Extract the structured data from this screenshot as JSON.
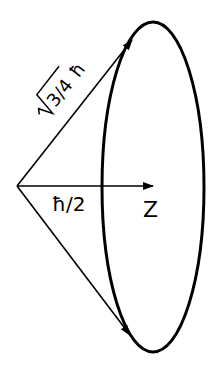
{
  "diagram": {
    "type": "spin-vector-cone",
    "labels": {
      "magnitude": "√3/4 ħ",
      "magnitude_radicand": "3/4",
      "hbar": "ħ",
      "projection": "ħ/2",
      "axis": "Z"
    },
    "colors": {
      "stroke": "#000000",
      "background": "#ffffff"
    },
    "elements": [
      {
        "name": "precession-ellipse",
        "center": [
          153,
          187
        ],
        "rx": 51,
        "ry": 165
      },
      {
        "name": "upper-spin-vector",
        "from": [
          17,
          186
        ],
        "to": [
          132,
          40
        ]
      },
      {
        "name": "lower-spin-vector",
        "from": [
          17,
          186
        ],
        "to": [
          130,
          335
        ]
      },
      {
        "name": "z-axis-arrow",
        "from": [
          17,
          186
        ],
        "to": [
          153,
          186
        ]
      }
    ]
  }
}
